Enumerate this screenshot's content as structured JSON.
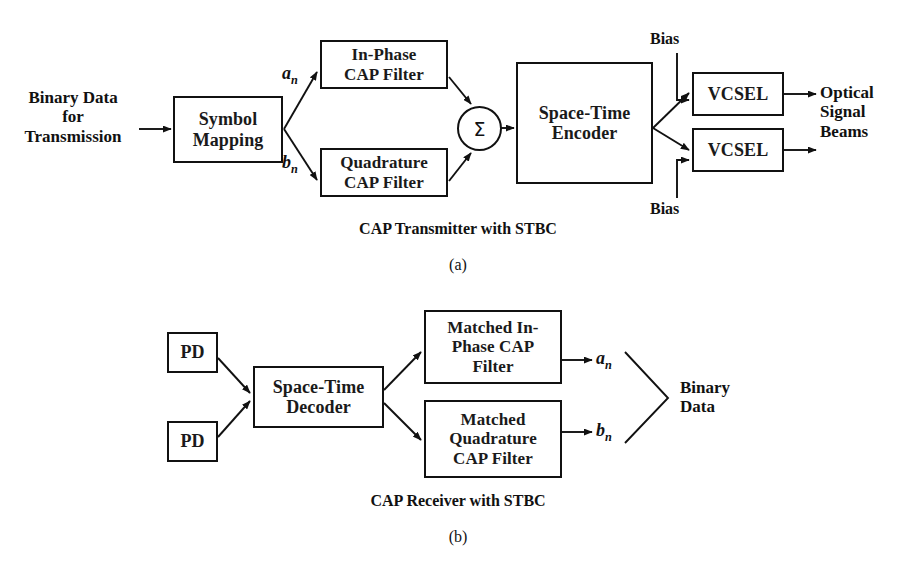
{
  "figure": {
    "width": 916,
    "height": 562,
    "background_color": "#ffffff",
    "line_color": "#111111",
    "text_color": "#111111"
  },
  "transmitter": {
    "caption": "CAP Transmitter with STBC",
    "subcaption": "(a)",
    "input_label": "Binary Data\nfor\nTransmission",
    "blocks": {
      "symbol_mapping": "Symbol\nMapping",
      "inphase_filter": "In-Phase\nCAP Filter",
      "quadrature_filter": "Quadrature\nCAP Filter",
      "summer": "Σ",
      "encoder": "Space-Time\nEncoder",
      "vcsel_top": "VCSEL",
      "vcsel_bottom": "VCSEL"
    },
    "signal_labels": {
      "a_n": "a",
      "a_n_sub": "n",
      "b_n": "b",
      "b_n_sub": "n"
    },
    "bias_top": "Bias",
    "bias_bottom": "Bias",
    "output_label": "Optical\nSignal\nBeams"
  },
  "receiver": {
    "caption": "CAP Receiver with STBC",
    "subcaption": "(b)",
    "blocks": {
      "pd_top": "PD",
      "pd_bottom": "PD",
      "decoder": "Space-Time\nDecoder",
      "matched_inphase": "Matched In-\nPhase CAP\nFilter",
      "matched_quadrature": "Matched\nQuadrature\nCAP Filter"
    },
    "signal_labels": {
      "a_n": "a",
      "a_n_sub": "n",
      "b_n": "b",
      "b_n_sub": "n"
    },
    "output_label": "Binary\nData"
  }
}
